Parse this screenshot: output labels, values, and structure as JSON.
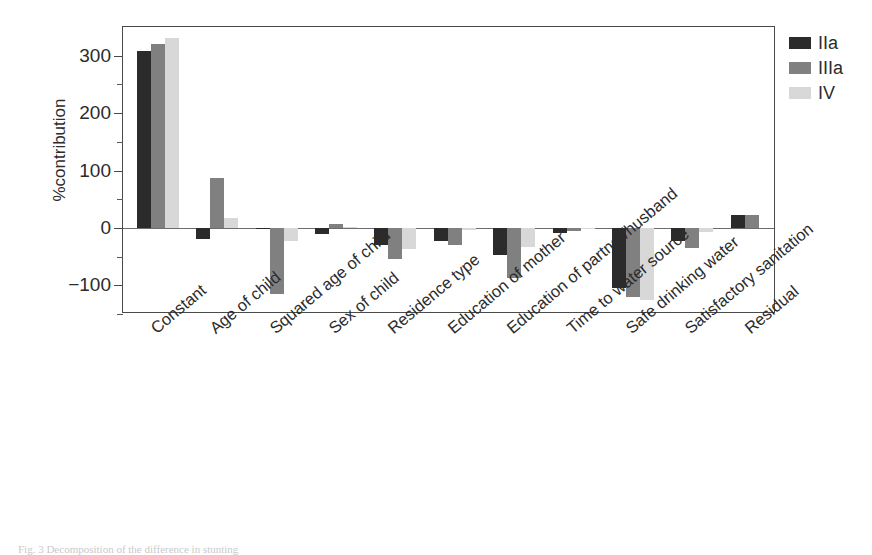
{
  "figure": {
    "caption": "Fig. 3   Decomposition of the difference in stunting"
  },
  "legend": {
    "position": "right",
    "items": [
      {
        "label": "IIa",
        "color": "#2b2b2b"
      },
      {
        "label": "IIIa",
        "color": "#808080"
      },
      {
        "label": "IV",
        "color": "#d8d8d8"
      }
    ]
  },
  "axes": {
    "ylabel": "%contribution",
    "yticks": [
      300,
      200,
      100,
      0,
      -100
    ],
    "ytick_labels": [
      "300",
      "200",
      "100",
      "0",
      "−100"
    ],
    "ylim": [
      -150,
      350
    ],
    "minor_ticks": [
      250,
      150,
      50,
      -50,
      -150
    ]
  },
  "chart_data": {
    "type": "bar",
    "title": "",
    "xlabel": "",
    "ylabel": "%contribution",
    "ylim": [
      -150,
      350
    ],
    "grid": false,
    "legend_position": "right",
    "categories": [
      "Constant",
      "Age of child",
      "Squared age of child",
      "Sex of child",
      "Residence type",
      "Education of mother",
      "Education of partner/husband",
      "Time to water source",
      "Safe drinking water",
      "Satisfactory sanitation",
      "Residual"
    ],
    "series": [
      {
        "name": "IIa",
        "color": "#2b2b2b",
        "values": [
          308,
          -20,
          -2,
          -11,
          -30,
          -22,
          -48,
          -9,
          -105,
          -22,
          22
        ]
      },
      {
        "name": "IIIa",
        "color": "#808080",
        "values": [
          320,
          87,
          -115,
          6,
          -55,
          -30,
          -88,
          -5,
          -120,
          -35,
          22
        ]
      },
      {
        "name": "IV",
        "color": "#d8d8d8",
        "values": [
          330,
          18,
          -23,
          1,
          -37,
          -4,
          -33,
          -1,
          -125,
          -8,
          0
        ]
      }
    ]
  }
}
